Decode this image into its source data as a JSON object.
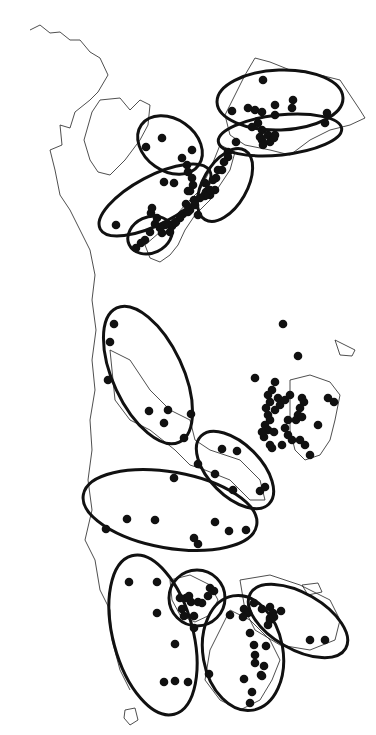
{
  "map": {
    "colors": {
      "background": "#ffffff",
      "ink": "#111111",
      "coast": "#222222"
    },
    "coastlines": [
      "M30,30 L40,25 L50,33 L60,32 L70,40 L80,40 L90,52 L100,58 L108,75 L98,92 L90,100 L75,112 L70,128 L60,125 L62,145 L50,150 L55,170 L60,195 L70,210 L80,230 L90,250 L95,275 L92,300 L96,330 L92,360 L95,390 L90,420 L92,450 L88,480 L92,510 L85,540 L95,560 L100,590 L110,610 L112,640 L120,670 L130,690",
      "M92,112 L100,100 L120,98 L130,110 L140,100 L150,105 L148,125 L140,140 L125,160 L110,175 L98,172 L90,160 L84,140 Z",
      "M255,58 L270,62 L290,70 L320,75 L340,80 L350,95 L360,110 L365,118 L350,125 L330,130 L310,140 L290,155 L270,150 L245,145 L230,135 L225,115 L235,95 L245,75 Z",
      "M220,145 L235,152 L230,170 L220,185 L210,200 L195,215 L185,230 L178,245 L170,255 L160,262 L150,258 L145,245 L160,232 L172,220 L185,205 L200,190 L210,170 Z",
      "M290,380 L310,375 L330,382 L340,395 L335,420 L330,440 L320,455 L305,460 L295,450 L290,430 Z",
      "M335,340 L345,345 L355,350 L352,356 L340,355 Z",
      "M110,350 L130,360 L150,390 L170,410 L190,420 L195,440 L210,450 L240,460 L260,480 L265,500 L250,500 L230,480 L205,470 L190,465 L175,450 L150,430 L130,420 L115,400 Z",
      "M170,580 L190,575 L210,585 L218,600 L210,615 L195,622 L180,615 L172,600 Z",
      "M240,580 L270,575 L300,585 L330,600 L340,620 L335,640 L310,650 L280,645 L255,630 L245,610 Z",
      "M230,610 L250,620 L270,640 L280,660 L272,680 L260,700 L240,710 L220,700 L205,680 L210,650 L220,630 Z",
      "M125,710 L135,708 L138,720 L130,725 L124,718 Z",
      "M302,585 L318,583 L322,592 L308,595 Z"
    ],
    "regions": [
      {
        "id": "A",
        "cx": 280,
        "cy": 100,
        "rx": 63,
        "ry": 30,
        "rot": -2
      },
      {
        "id": "B",
        "cx": 280,
        "cy": 135,
        "rx": 62,
        "ry": 20,
        "rot": -6
      },
      {
        "id": "C",
        "cx": 170,
        "cy": 145,
        "rx": 35,
        "ry": 26,
        "rot": 35
      },
      {
        "id": "D",
        "cx": 225,
        "cy": 185,
        "rx": 40,
        "ry": 22,
        "rot": -60
      },
      {
        "id": "E",
        "cx": 155,
        "cy": 200,
        "rx": 62,
        "ry": 24,
        "rot": -28
      },
      {
        "id": "F",
        "cx": 150,
        "cy": 235,
        "rx": 23,
        "ry": 18,
        "rot": -25
      },
      {
        "id": "G",
        "cx": 148,
        "cy": 375,
        "rx": 35,
        "ry": 74,
        "rot": -25
      },
      {
        "id": "H",
        "cx": 235,
        "cy": 470,
        "rx": 48,
        "ry": 26,
        "rot": 45
      },
      {
        "id": "I",
        "cx": 170,
        "cy": 510,
        "rx": 88,
        "ry": 38,
        "rot": 10
      },
      {
        "id": "J",
        "cx": 153,
        "cy": 635,
        "rx": 40,
        "ry": 82,
        "rot": -15
      },
      {
        "id": "K",
        "cx": 197,
        "cy": 598,
        "rx": 28,
        "ry": 28,
        "rot": 0
      },
      {
        "id": "L",
        "cx": 243,
        "cy": 653,
        "rx": 40,
        "ry": 58,
        "rot": -10
      },
      {
        "id": "M",
        "cx": 298,
        "cy": 621,
        "rx": 55,
        "ry": 28,
        "rot": 30
      }
    ],
    "sites": [
      [
        263,
        80
      ],
      [
        255,
        110
      ],
      [
        248,
        108
      ],
      [
        262,
        112
      ],
      [
        275,
        105
      ],
      [
        275,
        115
      ],
      [
        293,
        100
      ],
      [
        292,
        108
      ],
      [
        232,
        111
      ],
      [
        327,
        113
      ],
      [
        325,
        123
      ],
      [
        258,
        123
      ],
      [
        252,
        127
      ],
      [
        262,
        130
      ],
      [
        268,
        135
      ],
      [
        260,
        137
      ],
      [
        262,
        140
      ],
      [
        270,
        142
      ],
      [
        274,
        138
      ],
      [
        263,
        145
      ],
      [
        275,
        135
      ],
      [
        236,
        142
      ],
      [
        162,
        138
      ],
      [
        146,
        147
      ],
      [
        192,
        150
      ],
      [
        182,
        158
      ],
      [
        187,
        165
      ],
      [
        188,
        172
      ],
      [
        192,
        178
      ],
      [
        193,
        185
      ],
      [
        190,
        191
      ],
      [
        228,
        152
      ],
      [
        228,
        157
      ],
      [
        224,
        162
      ],
      [
        222,
        170
      ],
      [
        216,
        178
      ],
      [
        215,
        190
      ],
      [
        210,
        195
      ],
      [
        213,
        180
      ],
      [
        218,
        170
      ],
      [
        205,
        183
      ],
      [
        206,
        192
      ],
      [
        210,
        190
      ],
      [
        174,
        183
      ],
      [
        164,
        182
      ],
      [
        188,
        191
      ],
      [
        186,
        204
      ],
      [
        198,
        215
      ],
      [
        205,
        196
      ],
      [
        200,
        198
      ],
      [
        194,
        200
      ],
      [
        190,
        210
      ],
      [
        183,
        214
      ],
      [
        180,
        218
      ],
      [
        176,
        222
      ],
      [
        172,
        226
      ],
      [
        170,
        225
      ],
      [
        165,
        225
      ],
      [
        160,
        228
      ],
      [
        155,
        224
      ],
      [
        157,
        218
      ],
      [
        151,
        213
      ],
      [
        195,
        205
      ],
      [
        188,
        212
      ],
      [
        175,
        223
      ],
      [
        170,
        232
      ],
      [
        162,
        233
      ],
      [
        150,
        232
      ],
      [
        145,
        240
      ],
      [
        141,
        243
      ],
      [
        136,
        248
      ],
      [
        116,
        225
      ],
      [
        152,
        208
      ],
      [
        114,
        324
      ],
      [
        110,
        342
      ],
      [
        108,
        380
      ],
      [
        149,
        411
      ],
      [
        168,
        410
      ],
      [
        191,
        414
      ],
      [
        164,
        423
      ],
      [
        184,
        438
      ],
      [
        283,
        324
      ],
      [
        298,
        356
      ],
      [
        255,
        378
      ],
      [
        275,
        382
      ],
      [
        272,
        390
      ],
      [
        278,
        398
      ],
      [
        268,
        395
      ],
      [
        270,
        402
      ],
      [
        266,
        408
      ],
      [
        268,
        415
      ],
      [
        270,
        420
      ],
      [
        265,
        425
      ],
      [
        268,
        430
      ],
      [
        275,
        410
      ],
      [
        280,
        405
      ],
      [
        285,
        400
      ],
      [
        290,
        395
      ],
      [
        302,
        398
      ],
      [
        304,
        402
      ],
      [
        300,
        408
      ],
      [
        298,
        415
      ],
      [
        296,
        420
      ],
      [
        288,
        420
      ],
      [
        285,
        428
      ],
      [
        288,
        435
      ],
      [
        292,
        440
      ],
      [
        300,
        440
      ],
      [
        305,
        445
      ],
      [
        282,
        445
      ],
      [
        302,
        417
      ],
      [
        318,
        425
      ],
      [
        328,
        398
      ],
      [
        334,
        402
      ],
      [
        310,
        455
      ],
      [
        264,
        437
      ],
      [
        274,
        432
      ],
      [
        262,
        432
      ],
      [
        272,
        448
      ],
      [
        270,
        445
      ],
      [
        222,
        449
      ],
      [
        237,
        451
      ],
      [
        198,
        464
      ],
      [
        215,
        474
      ],
      [
        233,
        490
      ],
      [
        260,
        491
      ],
      [
        265,
        487
      ],
      [
        174,
        478
      ],
      [
        155,
        520
      ],
      [
        127,
        519
      ],
      [
        106,
        529
      ],
      [
        215,
        522
      ],
      [
        229,
        531
      ],
      [
        246,
        530
      ],
      [
        194,
        538
      ],
      [
        198,
        544
      ],
      [
        129,
        582
      ],
      [
        157,
        582
      ],
      [
        157,
        613
      ],
      [
        175,
        644
      ],
      [
        164,
        682
      ],
      [
        175,
        681
      ],
      [
        188,
        682
      ],
      [
        186,
        598
      ],
      [
        191,
        602
      ],
      [
        180,
        598
      ],
      [
        182,
        609
      ],
      [
        184,
        616
      ],
      [
        198,
        602
      ],
      [
        210,
        588
      ],
      [
        214,
        591
      ],
      [
        208,
        596
      ],
      [
        202,
        603
      ],
      [
        194,
        616
      ],
      [
        189,
        596
      ],
      [
        194,
        628
      ],
      [
        254,
        603
      ],
      [
        244,
        609
      ],
      [
        248,
        613
      ],
      [
        262,
        609
      ],
      [
        270,
        607
      ],
      [
        273,
        613
      ],
      [
        281,
        611
      ],
      [
        270,
        618
      ],
      [
        270,
        620
      ],
      [
        230,
        615
      ],
      [
        243,
        617
      ],
      [
        250,
        633
      ],
      [
        254,
        645
      ],
      [
        266,
        646
      ],
      [
        255,
        655
      ],
      [
        255,
        663
      ],
      [
        264,
        666
      ],
      [
        261,
        675
      ],
      [
        209,
        674
      ],
      [
        244,
        679
      ],
      [
        262,
        676
      ],
      [
        252,
        692
      ],
      [
        250,
        703
      ],
      [
        310,
        640
      ],
      [
        325,
        640
      ],
      [
        274,
        617
      ],
      [
        268,
        625
      ]
    ]
  }
}
